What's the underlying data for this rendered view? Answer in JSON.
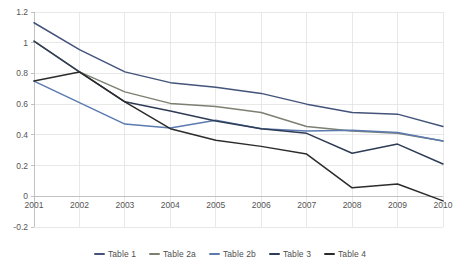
{
  "chart_data": {
    "type": "line",
    "title": "",
    "xlabel": "",
    "ylabel": "",
    "x": [
      "2001",
      "2002",
      "2003",
      "2004",
      "2005",
      "2006",
      "2007",
      "2008",
      "2009",
      "2010"
    ],
    "categories": [
      "2001",
      "2002",
      "2003",
      "2004",
      "2005",
      "2006",
      "2007",
      "2008",
      "2009",
      "2010"
    ],
    "ylim": [
      -0.2,
      1.2
    ],
    "yticks": [
      "1.2",
      "1",
      "0.8",
      "0.6",
      "0.4",
      "0.2",
      "0",
      "-0.2"
    ],
    "ytick_values": [
      1.2,
      1.0,
      0.8,
      0.6,
      0.4,
      0.2,
      0.0,
      -0.2
    ],
    "grid": true,
    "legend_position": "bottom",
    "series": [
      {
        "name": "Table 1",
        "color": "#43537a",
        "values": [
          1.13,
          0.955,
          0.81,
          0.74,
          0.71,
          0.67,
          0.6,
          0.545,
          0.535,
          0.455
        ]
      },
      {
        "name": "Table 2a",
        "color": "#7c8071",
        "values": [
          1.01,
          0.81,
          0.68,
          0.605,
          0.585,
          0.545,
          0.455,
          0.425,
          0.41,
          0.36
        ]
      },
      {
        "name": "Table 2b",
        "color": "#5b7ab0",
        "values": [
          0.75,
          0.61,
          0.47,
          0.445,
          0.495,
          0.44,
          0.425,
          0.43,
          0.415,
          0.36
        ]
      },
      {
        "name": "Table 3",
        "color": "#2e3b55",
        "values": [
          1.01,
          0.81,
          0.615,
          0.555,
          0.49,
          0.44,
          0.41,
          0.28,
          0.34,
          0.21
        ]
      },
      {
        "name": "Table 4",
        "color": "#2b2b2b",
        "values": [
          0.75,
          0.81,
          0.615,
          0.44,
          0.365,
          0.325,
          0.275,
          0.055,
          0.08,
          -0.03
        ]
      }
    ]
  },
  "legend": {
    "items": [
      {
        "label": "Table 1",
        "color": "#43537a"
      },
      {
        "label": "Table 2a",
        "color": "#7c8071"
      },
      {
        "label": "Table 2b",
        "color": "#5b7ab0"
      },
      {
        "label": "Table 3",
        "color": "#2e3b55"
      },
      {
        "label": "Table 4",
        "color": "#2b2b2b"
      }
    ]
  }
}
